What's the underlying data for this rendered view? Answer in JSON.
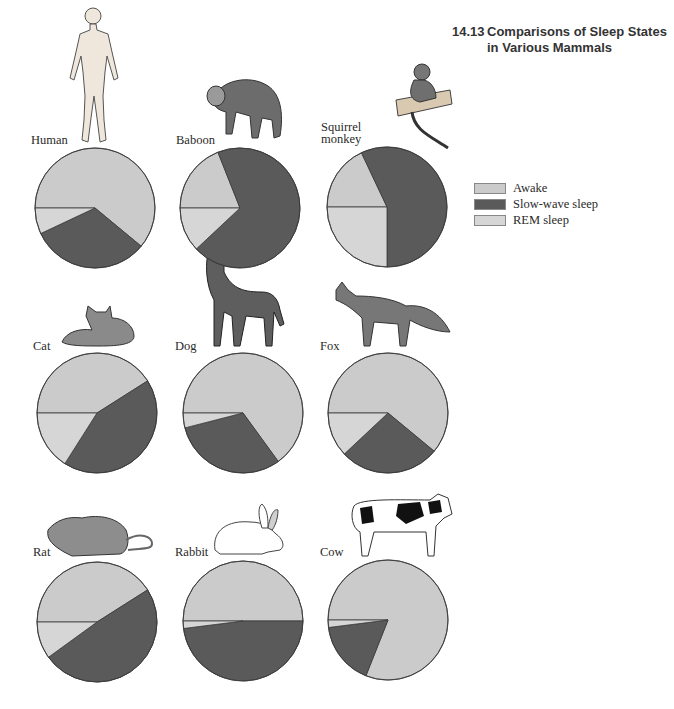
{
  "figure": {
    "number": "14.13",
    "title_line1": "Comparisons of Sleep States",
    "title_line2": "in Various Mammals"
  },
  "colors": {
    "awake": "#cbcbcb",
    "slow_wave": "#5a5a5a",
    "rem": "#d6d6d6",
    "outline": "#3a3a3a"
  },
  "legend": [
    {
      "label": "Awake",
      "key": "awake"
    },
    {
      "label": "Slow-wave sleep",
      "key": "slow_wave"
    },
    {
      "label": "REM sleep",
      "key": "rem"
    }
  ],
  "animals": [
    {
      "name": "Human",
      "label_lines": [
        "Human"
      ]
    },
    {
      "name": "Baboon",
      "label_lines": [
        "Baboon"
      ]
    },
    {
      "name": "Squirrel monkey",
      "label_lines": [
        "Squirrel",
        "monkey"
      ]
    },
    {
      "name": "Cat",
      "label_lines": [
        "Cat"
      ]
    },
    {
      "name": "Dog",
      "label_lines": [
        "Dog"
      ]
    },
    {
      "name": "Fox",
      "label_lines": [
        "Fox"
      ]
    },
    {
      "name": "Rat",
      "label_lines": [
        "Rat"
      ]
    },
    {
      "name": "Rabbit",
      "label_lines": [
        "Rabbit"
      ]
    },
    {
      "name": "Cow",
      "label_lines": [
        "Cow"
      ]
    }
  ],
  "chart_data": {
    "type": "pie",
    "title": "Comparisons of Sleep States in Various Mammals",
    "legend_position": "right",
    "slice_order": [
      "Awake",
      "Slow-wave sleep",
      "REM sleep"
    ],
    "start_angle": "9 o'clock, clockwise",
    "units": "percent of 24-hour day (estimated from slice angles)",
    "pies": [
      {
        "animal": "Human",
        "values": [
          61,
          32,
          7
        ]
      },
      {
        "animal": "Baboon",
        "values": [
          19,
          69,
          12
        ]
      },
      {
        "animal": "Squirrel monkey",
        "values": [
          18,
          57,
          25
        ]
      },
      {
        "animal": "Cat",
        "values": [
          41,
          43,
          16
        ]
      },
      {
        "animal": "Dog",
        "values": [
          65,
          31,
          4
        ]
      },
      {
        "animal": "Fox",
        "values": [
          61,
          27,
          12
        ]
      },
      {
        "animal": "Rat",
        "values": [
          41,
          49,
          10
        ]
      },
      {
        "animal": "Rabbit",
        "values": [
          50,
          48,
          2
        ]
      },
      {
        "animal": "Cow",
        "values": [
          81,
          17,
          2
        ]
      }
    ]
  }
}
